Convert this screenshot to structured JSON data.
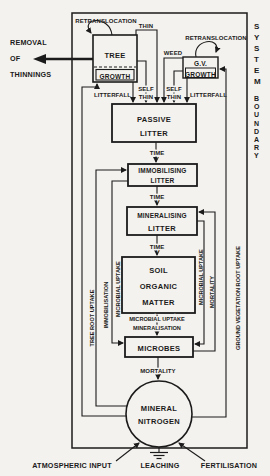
{
  "diagram": {
    "boundary": {
      "word1": "SYSTEM",
      "word2": "BOUNDARY"
    },
    "external": {
      "removal_line1": "REMOVAL",
      "removal_line2": "OF",
      "removal_line3": "THINNINGS",
      "atmospheric_input": "ATMOSPHERIC INPUT",
      "leaching": "LEACHING",
      "fertilisation": "FERTILISATION"
    },
    "boxes": {
      "tree": {
        "line1": "TREE",
        "line2": "GROWTH"
      },
      "gv": {
        "line1": "G.V.",
        "line2": "GROWTH"
      },
      "passive_litter": {
        "line1": "PASSIVE",
        "line2": "LITTER"
      },
      "immobilising_litter": {
        "line1": "IMMOBILISING",
        "line2": "LITTER"
      },
      "mineralising_litter": {
        "line1": "MINERALISING",
        "line2": "LITTER"
      },
      "soil_organic_matter": {
        "line1": "SOIL",
        "line2": "ORGANIC",
        "line3": "MATTER"
      },
      "microbes": {
        "label": "MICROBES"
      },
      "mineral_nitrogen": {
        "line1": "MINERAL",
        "line2": "NITROGEN"
      }
    },
    "flows": {
      "retranslocation_tree": "RETRANSLOCATION",
      "retranslocation_gv": "RETRANSLOCATION",
      "thin": "THIN",
      "weed": "WEED",
      "self_thin_tree_word1": "SELF",
      "self_thin_tree_word2": "THIN",
      "self_thin_gv_word1": "SELF",
      "self_thin_gv_word2": "THIN",
      "litterfall_tree": "LITTERFALL",
      "litterfall_gv": "LITTERFALL",
      "time_1": "TIME",
      "time_2": "TIME",
      "time_3": "TIME",
      "microbial_uptake_centre": "MICROBIAL UPTAKE",
      "mineralisation": "MINERALISATION",
      "mortality_centre": "MORTALITY",
      "tree_root_uptake": "TREE ROOT UPTAKE",
      "immobilisation": "IMMOBILISATION",
      "microbial_uptake_left": "MICROBIAL UPTAKE",
      "microbial_uptake_right": "MICROBIAL UPTAKE",
      "mortality_right": "MORTALITY",
      "gv_root_uptake": "GROUND VEGETATION ROOT UPTAKE"
    },
    "colors": {
      "ink": "#1b1b1b",
      "paper": "#f4f2ee"
    }
  }
}
